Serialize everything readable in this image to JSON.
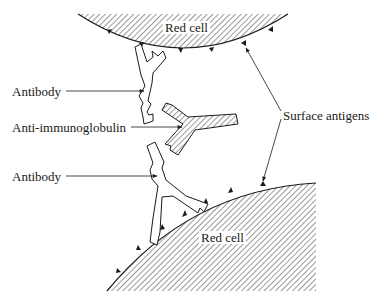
{
  "diagram": {
    "title": "",
    "cells": [
      {
        "id": "top",
        "label": "Red cell"
      },
      {
        "id": "bottom",
        "label": "Red cell"
      }
    ],
    "labels": {
      "antibody_top": "Antibody",
      "anti_immunoglobulin": "Anti-immunoglobulin",
      "antibody_bottom": "Antibody",
      "surface_antigens": "Surface antigens"
    },
    "colors": {
      "ink": "#1a1a1a",
      "hatch": "#333333",
      "background": "#ffffff"
    }
  }
}
